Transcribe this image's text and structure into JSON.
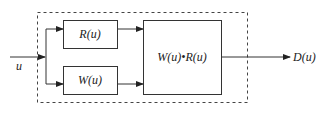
{
  "diagram": {
    "input_label": "u",
    "output_label": "D(u)",
    "blocks": [
      {
        "id": "r",
        "label": "R(u)"
      },
      {
        "id": "w",
        "label": "W(u)"
      },
      {
        "id": "product",
        "label": "W(u)•R(u)"
      }
    ],
    "colors": {
      "line": "#333333",
      "dash": "#444444",
      "background": "#ffffff"
    }
  }
}
